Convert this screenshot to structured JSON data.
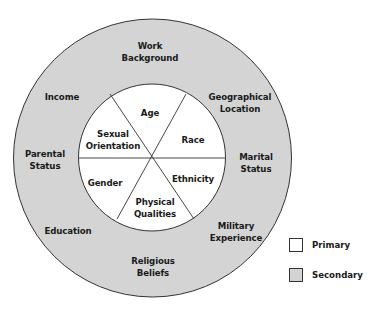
{
  "diagram": {
    "title": "",
    "colors": {
      "primary_fill": "#ffffff",
      "secondary_fill": "#d4d4d4",
      "stroke": "#333333"
    },
    "primary_ring": [
      {
        "label": "Age"
      },
      {
        "label": "Race"
      },
      {
        "label": "Ethnicity"
      },
      {
        "label": "Physical\nQualities"
      },
      {
        "label": "Gender"
      },
      {
        "label": "Sexual\nOrientation"
      }
    ],
    "secondary_ring": [
      {
        "label": "Work\nBackground"
      },
      {
        "label": "Geographical\nLocation"
      },
      {
        "label": "Marital\nStatus"
      },
      {
        "label": "Military\nExperience"
      },
      {
        "label": "Religious\nBeliefs"
      },
      {
        "label": "Education"
      },
      {
        "label": "Parental\nStatus"
      },
      {
        "label": "Income"
      }
    ],
    "legend": [
      {
        "label": "Primary",
        "color": "#ffffff"
      },
      {
        "label": "Secondary",
        "color": "#d4d4d4"
      }
    ]
  }
}
